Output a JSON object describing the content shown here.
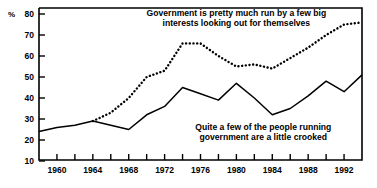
{
  "chart_data": {
    "type": "line",
    "title": "",
    "xlabel": "",
    "ylabel": "%",
    "ylim": [
      10,
      80
    ],
    "xlim": [
      1958,
      1994
    ],
    "ytick_labels": [
      "80",
      "70",
      "60",
      "50",
      "40",
      "30",
      "20",
      "10"
    ],
    "yticks": [
      80,
      70,
      60,
      50,
      40,
      30,
      20,
      10
    ],
    "xtick_labels": [
      "1960",
      "1964",
      "1968",
      "1972",
      "1976",
      "1980",
      "1984",
      "1988",
      "1992"
    ],
    "xticks": [
      1960,
      1964,
      1968,
      1972,
      1976,
      1980,
      1984,
      1988,
      1992
    ],
    "minor_xticks": [
      1958,
      1962,
      1966,
      1970,
      1974,
      1978,
      1982,
      1986,
      1990,
      1994
    ],
    "grid": false,
    "legend_position": "inline-annotation",
    "series": [
      {
        "name": "Government is pretty much run by a few big interests looking out for themselves",
        "style": "dotted",
        "color": "#000000",
        "x": [
          1964,
          1966,
          1968,
          1970,
          1972,
          1974,
          1976,
          1978,
          1980,
          1982,
          1984,
          1986,
          1988,
          1990,
          1992,
          1994
        ],
        "values": [
          29,
          33,
          40,
          50,
          53,
          66,
          66,
          60,
          55,
          56,
          54,
          59,
          64,
          70,
          75,
          76
        ]
      },
      {
        "name": "Quite a few of the people running government are a little crooked",
        "style": "solid",
        "color": "#000000",
        "x": [
          1958,
          1960,
          1962,
          1964,
          1966,
          1968,
          1970,
          1972,
          1974,
          1976,
          1978,
          1980,
          1982,
          1984,
          1986,
          1988,
          1990,
          1992,
          1994
        ],
        "values": [
          24,
          26,
          27,
          29,
          27,
          25,
          32,
          36,
          45,
          42,
          39,
          47,
          40,
          32,
          35,
          41,
          48,
          43,
          51
        ]
      }
    ],
    "annotations": [
      {
        "id": "annotation-dotted",
        "lines": [
          "Government is pretty much run by a few big",
          "interests looking out for themselves"
        ],
        "x": 1980,
        "y": 79
      },
      {
        "id": "annotation-solid",
        "lines": [
          "Quite a few of the people running",
          "government are a little crooked"
        ],
        "x": 1983,
        "y": 25
      }
    ]
  }
}
